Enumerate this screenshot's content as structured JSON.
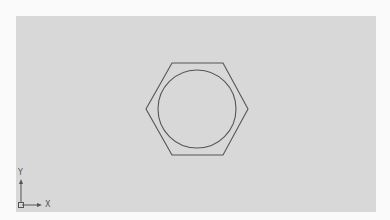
{
  "viewport": {
    "background": "#d8d8d8",
    "border_color": "#fafafa"
  },
  "drawing": {
    "stroke_color": "#555555",
    "hexagon": {
      "points": [
        [
          172,
          63
        ],
        [
          223,
          63
        ],
        [
          248,
          109
        ],
        [
          223,
          155
        ],
        [
          172,
          155
        ],
        [
          146,
          109
        ]
      ]
    },
    "circle": {
      "cx": 197,
      "cy": 109,
      "r": 39
    }
  },
  "ucs_icon": {
    "x_label": "X",
    "y_label": "Y"
  }
}
